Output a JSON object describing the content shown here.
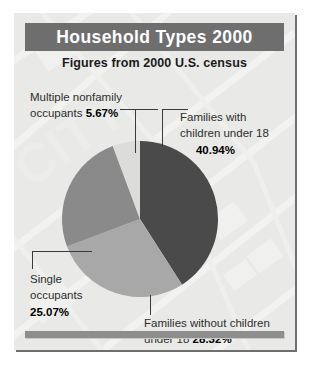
{
  "panel": {
    "title": "Household Types 2000",
    "subtitle": "Figures from 2000 U.S. census"
  },
  "colors": {
    "title_bar": "#6e6e6e",
    "panel_background": "#e9e9e7",
    "footer_bar": "#8e8e8e",
    "slice_families_with_children": "#4a4a4a",
    "slice_families_without_children": "#a8a8a8",
    "slice_single_occupants": "#8a8a8a",
    "slice_multiple_nonfamily": "#dcdcda",
    "leader_line": "#3b3b3b",
    "label_text": "#2e2e2e"
  },
  "labels": {
    "nonfamily": {
      "line1": "Multiple nonfamily",
      "line2_prefix": "occupants ",
      "value": "5.67%"
    },
    "families_with": {
      "line1": "Families with",
      "line2": "children under 18",
      "value": "40.94%"
    },
    "single": {
      "line1": "Single",
      "line2": "occupants",
      "value": "25.07%"
    },
    "families_without": {
      "line1": "Families without children",
      "line2_prefix": "under 18 ",
      "value": "28.32%"
    }
  },
  "chart_data": {
    "type": "pie",
    "title": "Household Types 2000",
    "subtitle": "Figures from 2000 U.S. census",
    "unit": "percent",
    "total": 100.0,
    "start_angle_deg": 0,
    "direction": "clockwise",
    "legend_position": "callout-labels",
    "categories": [
      "Families with children under 18",
      "Families without children under 18",
      "Single occupants",
      "Multiple nonfamily occupants"
    ],
    "values": [
      40.94,
      28.32,
      25.07,
      5.67
    ],
    "slices": [
      {
        "label": "Families with children under 18",
        "value": 40.94,
        "display": "40.94%",
        "color": "#4a4a4a",
        "start_deg": 0.0,
        "sweep_deg": 147.38
      },
      {
        "label": "Families without children under 18",
        "value": 28.32,
        "display": "28.32%",
        "color": "#a8a8a8",
        "start_deg": 147.38,
        "sweep_deg": 101.95
      },
      {
        "label": "Single occupants",
        "value": 25.07,
        "display": "25.07%",
        "color": "#8a8a8a",
        "start_deg": 249.33,
        "sweep_deg": 90.25
      },
      {
        "label": "Multiple nonfamily occupants",
        "value": 5.67,
        "display": "5.67%",
        "color": "#dcdcda",
        "start_deg": 339.58,
        "sweep_deg": 20.42
      }
    ]
  }
}
